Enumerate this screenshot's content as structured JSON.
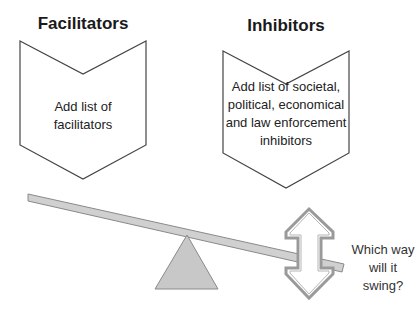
{
  "facilitators": {
    "heading": "Facilitators",
    "body": "Add list of facilitators"
  },
  "inhibitors": {
    "heading": "Inhibitors",
    "body": "Add list of societal, political, economical and law enforcement inhibitors"
  },
  "seesaw": {
    "question": "Which way will it swing?",
    "beam_color": "#d0d0d0",
    "fulcrum_color": "#c8c8c8",
    "outline_color": "#7a7a7a"
  }
}
